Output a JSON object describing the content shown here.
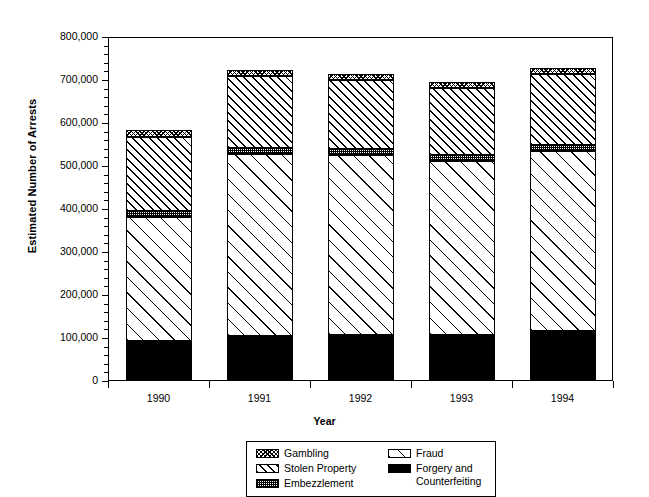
{
  "chart_data": {
    "type": "bar",
    "subtype": "stacked-bar",
    "title": "",
    "xlabel": "Year",
    "ylabel": "Estimated Number of Arrests",
    "categories": [
      "1990",
      "1991",
      "1992",
      "1993",
      "1994"
    ],
    "ylim": [
      0,
      800000
    ],
    "ytick_values": [
      0,
      100000,
      200000,
      300000,
      400000,
      500000,
      600000,
      700000,
      800000
    ],
    "ytick_labels": [
      "0",
      "100,000",
      "200,000",
      "300,000",
      "400,000",
      "500,000",
      "600,000",
      "700,000",
      "800,000"
    ],
    "ytick_minor_interval": 20000,
    "grid": false,
    "legend_position": "bottom-center",
    "stack_order_bottom_to_top": [
      "Forgery and Counterfeiting",
      "Fraud",
      "Embezzlement",
      "Stolen Property",
      "Gambling"
    ],
    "series": [
      {
        "name": "Forgery and Counterfeiting",
        "pattern": "solid-black",
        "values": [
          93000,
          105000,
          107000,
          108000,
          116000
        ]
      },
      {
        "name": "Fraud",
        "pattern": "sparse-diagonal",
        "values": [
          288000,
          423000,
          419000,
          404000,
          419000
        ]
      },
      {
        "name": "Embezzlement",
        "pattern": "fine-stipple",
        "values": [
          14000,
          14000,
          14000,
          14000,
          14000
        ]
      },
      {
        "name": "Stolen Property",
        "pattern": "diagonal-hatch",
        "values": [
          172000,
          167000,
          160000,
          156000,
          165000
        ]
      },
      {
        "name": "Gambling",
        "pattern": "dense-crosshatch",
        "values": [
          16000,
          14000,
          14000,
          14000,
          14000
        ]
      }
    ],
    "totals": [
      583000,
      723000,
      714000,
      696000,
      728000
    ]
  },
  "axes": {
    "ylabel": "Estimated Number of Arrests",
    "xlabel": "Year"
  },
  "legend": {
    "left_column": [
      {
        "label": "Gambling",
        "swatch": "dense-crosshatch-swatch"
      },
      {
        "label": "Stolen Property",
        "swatch": "diagonal-hatch-swatch"
      },
      {
        "label": "Embezzlement",
        "swatch": "fine-stipple-swatch"
      }
    ],
    "right_column": [
      {
        "label": "Fraud",
        "swatch": "sparse-diagonal-swatch"
      },
      {
        "label": "Forgery and\nCounterfeiting",
        "swatch": "solid-black-swatch"
      }
    ]
  },
  "colors": {
    "ink": "#000000",
    "background": "#ffffff"
  }
}
